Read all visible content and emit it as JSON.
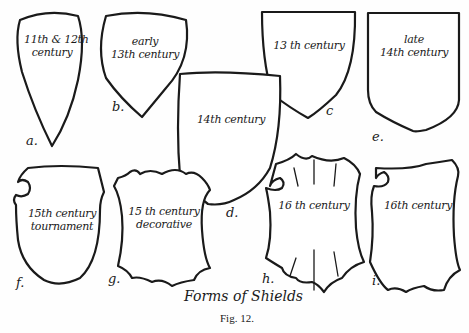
{
  "figure": {
    "title": "Forms of Shields",
    "caption": "Fig. 12.",
    "shields": [
      {
        "letter": "a.",
        "line1": "11th & 12th",
        "line2": "century"
      },
      {
        "letter": "b.",
        "line1": "early",
        "line2": "13th century"
      },
      {
        "letter": "c",
        "line1": "13 th century",
        "line2": ""
      },
      {
        "letter": "d.",
        "line1": "14th century",
        "line2": ""
      },
      {
        "letter": "e.",
        "line1": "late",
        "line2": "14th century"
      },
      {
        "letter": "f.",
        "line1": "15th century",
        "line2": "tournament"
      },
      {
        "letter": "g.",
        "line1": "15 th century",
        "line2": "decorative"
      },
      {
        "letter": "h.",
        "line1": "16 th century",
        "line2": ""
      },
      {
        "letter": "i.",
        "line1": "16th century",
        "line2": ""
      }
    ]
  }
}
